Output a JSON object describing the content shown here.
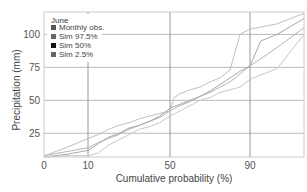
{
  "chart_data": {
    "type": "line",
    "title": "",
    "xlabel": "Cumulative probability (%)",
    "ylabel": "Precipitation (mm)",
    "xscale": "probability",
    "xlim": [
      0,
      100
    ],
    "ylim": [
      7,
      117
    ],
    "xticks": [
      0,
      10,
      50,
      90
    ],
    "xtick_labels": [
      "0",
      "10",
      "50",
      "90"
    ],
    "yticks": [
      25,
      50,
      75,
      100
    ],
    "ytick_labels": [
      "25",
      "50",
      "75",
      "100"
    ],
    "grid": true,
    "legend": {
      "title": "June",
      "placement": "top-left",
      "entries": [
        {
          "label": "Monthly obs.",
          "color": "#555555"
        },
        {
          "label": "Sim 97.5%",
          "color": "#666666"
        },
        {
          "label": "Sim 50%",
          "color": "#111111"
        },
        {
          "label": "Sim 2.5%",
          "color": "#666666"
        }
      ]
    },
    "series": [
      {
        "name": "Monthly obs.",
        "color": "#b5b5b5",
        "x": [
          0,
          5,
          10,
          15,
          20,
          25,
          30,
          35,
          40,
          45,
          50,
          55,
          60,
          65,
          70,
          75,
          80,
          85,
          90,
          95,
          100
        ],
        "y": [
          8,
          11,
          14,
          18,
          21,
          24,
          28,
          31,
          34,
          37,
          42,
          46,
          49,
          53,
          56,
          60,
          64,
          70,
          76,
          90,
          105
        ]
      },
      {
        "name": "Sim 97.5%",
        "color": "#c0c0c0",
        "x": [
          0,
          5,
          10,
          15,
          20,
          25,
          30,
          35,
          40,
          45,
          50,
          52,
          55,
          60,
          65,
          70,
          75,
          80,
          85,
          90,
          95,
          100
        ],
        "y": [
          8,
          14,
          21,
          24,
          28,
          31,
          33,
          36,
          38,
          40,
          42,
          52,
          55,
          58,
          60,
          64,
          67,
          73,
          100,
          104,
          108,
          116
        ]
      },
      {
        "name": "Sim 50%",
        "color": "#a8a8a8",
        "x": [
          0,
          5,
          10,
          15,
          20,
          25,
          30,
          35,
          40,
          45,
          50,
          55,
          60,
          65,
          70,
          75,
          80,
          85,
          90,
          92,
          95,
          100
        ],
        "y": [
          7,
          9,
          12,
          17,
          22,
          25,
          29,
          31,
          34,
          38,
          44,
          47,
          50,
          53,
          57,
          62,
          67,
          72,
          76,
          95,
          100,
          112
        ]
      },
      {
        "name": "Sim 2.5%",
        "color": "#c8c8c8",
        "x": [
          0,
          5,
          10,
          15,
          20,
          25,
          30,
          35,
          40,
          45,
          50,
          55,
          60,
          65,
          70,
          75,
          80,
          85,
          90,
          95,
          100
        ],
        "y": [
          7,
          8,
          8,
          10,
          16,
          20,
          24,
          28,
          30,
          33,
          38,
          42,
          46,
          50,
          52,
          56,
          58,
          60,
          66,
          74,
          100
        ]
      }
    ]
  }
}
